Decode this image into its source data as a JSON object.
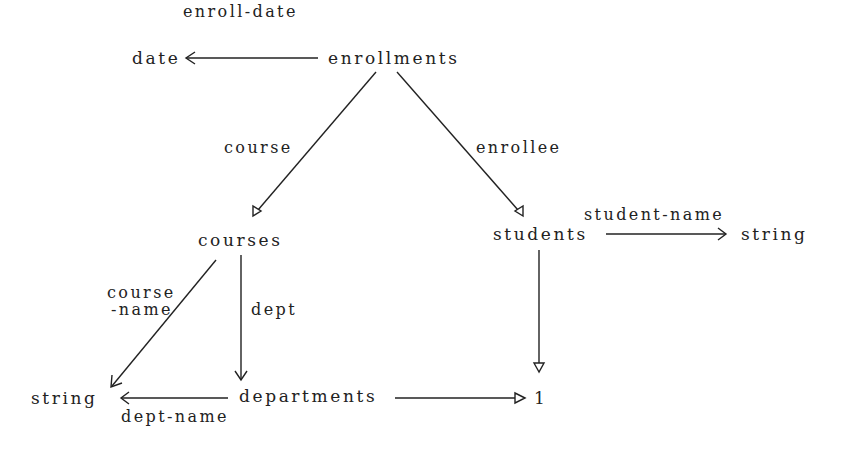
{
  "diagram": {
    "type": "schema-graph",
    "nodes": {
      "enrollments": "enrollments",
      "date": "date",
      "courses": "courses",
      "students": "students",
      "string_right": "string",
      "string_left": "string",
      "departments": "departments",
      "one": "1"
    },
    "edges": {
      "enroll_date": "enroll-date",
      "course": "course",
      "enrollee": "enrollee",
      "student_name": "student-name",
      "course_name_1": "course",
      "course_name_2": "-name",
      "dept": "dept",
      "dept_name": "dept-name"
    },
    "edge_list": [
      {
        "from": "enrollments",
        "to": "date",
        "label": "enroll-date",
        "arrow": "open"
      },
      {
        "from": "enrollments",
        "to": "courses",
        "label": "course",
        "arrow": "hollow-triangle"
      },
      {
        "from": "enrollments",
        "to": "students",
        "label": "enrollee",
        "arrow": "hollow-triangle"
      },
      {
        "from": "students",
        "to": "string",
        "label": "student-name",
        "arrow": "open"
      },
      {
        "from": "courses",
        "to": "string",
        "label": "course-name",
        "arrow": "open"
      },
      {
        "from": "courses",
        "to": "departments",
        "label": "dept",
        "arrow": "open"
      },
      {
        "from": "departments",
        "to": "string",
        "label": "dept-name",
        "arrow": "open"
      },
      {
        "from": "departments",
        "to": "1",
        "label": "",
        "arrow": "hollow-triangle"
      },
      {
        "from": "students",
        "to": "1",
        "label": "",
        "arrow": "hollow-triangle"
      }
    ],
    "colors": {
      "ink": "#222222",
      "background": "#ffffff"
    }
  }
}
